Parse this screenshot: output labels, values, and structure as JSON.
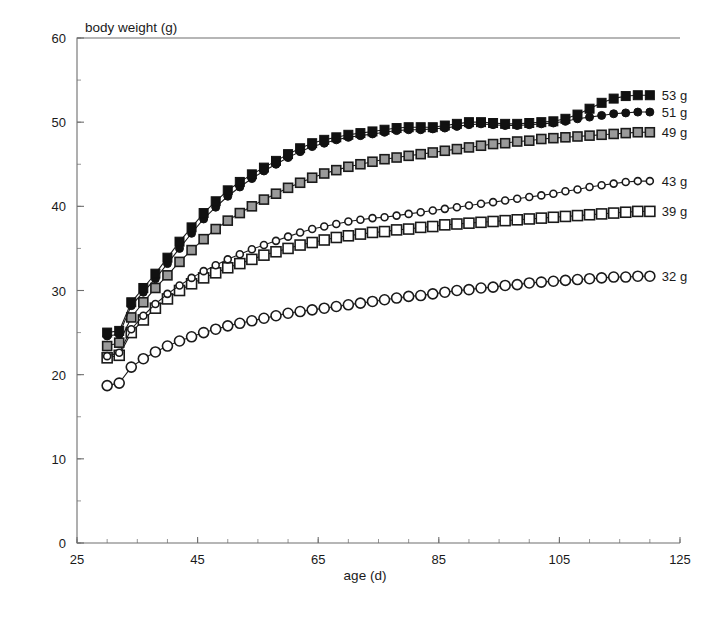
{
  "chart_data": {
    "type": "line",
    "title": "",
    "xlabel": "age (d)",
    "ylabel": "body weight (g)",
    "xlim": [
      25,
      125
    ],
    "ylim": [
      0,
      60
    ],
    "x_ticks": [
      25,
      45,
      65,
      85,
      105,
      125
    ],
    "y_ticks": [
      0,
      10,
      20,
      30,
      40,
      50,
      60
    ],
    "x_minor_step": 5,
    "y_minor_step": 5,
    "grid": false,
    "legend_position": "right-end-labels",
    "series": [
      {
        "name": "53 g",
        "label": "53 g",
        "marker": "filled-square",
        "marker_size": 9,
        "fill": "#111111",
        "stroke": "#111111",
        "x": [
          30,
          32,
          34,
          36,
          38,
          40,
          42,
          44,
          46,
          48,
          50,
          52,
          54,
          56,
          58,
          60,
          62,
          64,
          66,
          68,
          70,
          72,
          74,
          76,
          78,
          80,
          82,
          84,
          86,
          88,
          90,
          92,
          94,
          96,
          98,
          100,
          102,
          104,
          106,
          108,
          110,
          112,
          114,
          116,
          118,
          120
        ],
        "y": [
          25.0,
          25.2,
          28.6,
          30.3,
          32.0,
          33.9,
          35.8,
          37.5,
          39.2,
          40.6,
          41.9,
          42.9,
          43.8,
          44.6,
          45.4,
          46.2,
          46.9,
          47.5,
          47.9,
          48.2,
          48.5,
          48.7,
          48.9,
          49.1,
          49.3,
          49.4,
          49.4,
          49.4,
          49.6,
          49.8,
          50.0,
          50.0,
          49.9,
          49.8,
          49.8,
          49.9,
          50.0,
          50.1,
          50.4,
          50.9,
          51.6,
          52.3,
          52.8,
          53.1,
          53.2,
          53.2
        ]
      },
      {
        "name": "51 g",
        "label": "51 g",
        "marker": "filled-circle",
        "marker_size": 8,
        "fill": "#111111",
        "stroke": "#111111",
        "x": [
          30,
          32,
          34,
          36,
          38,
          40,
          42,
          44,
          46,
          48,
          50,
          52,
          54,
          56,
          58,
          60,
          62,
          64,
          66,
          68,
          70,
          72,
          74,
          76,
          78,
          80,
          82,
          84,
          86,
          88,
          90,
          92,
          94,
          96,
          98,
          100,
          102,
          104,
          106,
          108,
          110,
          112,
          114,
          116,
          118,
          120
        ],
        "y": [
          24.6,
          24.8,
          28.2,
          29.8,
          31.4,
          33.2,
          35.0,
          36.8,
          38.5,
          39.9,
          41.2,
          42.3,
          43.3,
          44.2,
          45.0,
          45.8,
          46.5,
          47.1,
          47.5,
          47.9,
          48.2,
          48.4,
          48.6,
          48.8,
          49.0,
          49.1,
          49.1,
          49.2,
          49.3,
          49.5,
          49.7,
          49.8,
          49.7,
          49.6,
          49.6,
          49.7,
          49.8,
          49.9,
          50.1,
          50.4,
          50.6,
          50.8,
          51.0,
          51.1,
          51.2,
          51.2
        ]
      },
      {
        "name": "49 g",
        "label": "49 g",
        "marker": "gray-square",
        "marker_size": 9,
        "fill": "#9a9a9a",
        "stroke": "#1a1a1a",
        "x": [
          30,
          32,
          34,
          36,
          38,
          40,
          42,
          44,
          46,
          48,
          50,
          52,
          54,
          56,
          58,
          60,
          62,
          64,
          66,
          68,
          70,
          72,
          74,
          76,
          78,
          80,
          82,
          84,
          86,
          88,
          90,
          92,
          94,
          96,
          98,
          100,
          102,
          104,
          106,
          108,
          110,
          112,
          114,
          116,
          118,
          120
        ],
        "y": [
          23.4,
          23.8,
          26.8,
          28.6,
          30.3,
          31.8,
          33.4,
          34.8,
          36.1,
          37.3,
          38.3,
          39.2,
          40.0,
          40.8,
          41.5,
          42.2,
          42.8,
          43.4,
          43.9,
          44.3,
          44.7,
          45.0,
          45.3,
          45.6,
          45.8,
          46.0,
          46.2,
          46.4,
          46.6,
          46.8,
          47.0,
          47.2,
          47.4,
          47.5,
          47.7,
          47.8,
          48.0,
          48.1,
          48.2,
          48.3,
          48.4,
          48.5,
          48.6,
          48.7,
          48.8,
          48.8
        ]
      },
      {
        "name": "43 g",
        "label": "43 g",
        "marker": "open-circle-small",
        "marker_size": 7,
        "fill": "#ffffff",
        "stroke": "#1a1a1a",
        "x": [
          30,
          32,
          34,
          36,
          38,
          40,
          42,
          44,
          46,
          48,
          50,
          52,
          54,
          56,
          58,
          60,
          62,
          64,
          66,
          68,
          70,
          72,
          74,
          76,
          78,
          80,
          82,
          84,
          86,
          88,
          90,
          92,
          94,
          96,
          98,
          100,
          102,
          104,
          106,
          108,
          110,
          112,
          114,
          116,
          118,
          120
        ],
        "y": [
          22.2,
          22.6,
          25.4,
          27.0,
          28.4,
          29.6,
          30.6,
          31.5,
          32.3,
          33.0,
          33.7,
          34.3,
          34.9,
          35.4,
          35.9,
          36.4,
          36.9,
          37.3,
          37.6,
          37.9,
          38.2,
          38.4,
          38.6,
          38.7,
          38.9,
          39.1,
          39.3,
          39.5,
          39.7,
          39.9,
          40.1,
          40.3,
          40.5,
          40.7,
          40.9,
          41.1,
          41.3,
          41.5,
          41.8,
          42.0,
          42.3,
          42.5,
          42.7,
          42.9,
          43.0,
          43.0
        ]
      },
      {
        "name": "39 g",
        "label": "39 g",
        "marker": "open-square",
        "marker_size": 10,
        "fill": "#ffffff",
        "stroke": "#1a1a1a",
        "x": [
          30,
          32,
          34,
          36,
          38,
          40,
          42,
          44,
          46,
          48,
          50,
          52,
          54,
          56,
          58,
          60,
          62,
          64,
          66,
          68,
          70,
          72,
          74,
          76,
          78,
          80,
          82,
          84,
          86,
          88,
          90,
          92,
          94,
          96,
          98,
          100,
          102,
          104,
          106,
          108,
          110,
          112,
          114,
          116,
          118,
          120
        ],
        "y": [
          22.0,
          22.3,
          25.0,
          26.5,
          27.9,
          29.0,
          30.0,
          30.8,
          31.5,
          32.1,
          32.7,
          33.2,
          33.7,
          34.2,
          34.6,
          35.0,
          35.4,
          35.7,
          36.0,
          36.3,
          36.5,
          36.7,
          36.9,
          37.0,
          37.2,
          37.3,
          37.5,
          37.6,
          37.8,
          37.9,
          38.0,
          38.1,
          38.2,
          38.3,
          38.4,
          38.5,
          38.6,
          38.7,
          38.8,
          38.9,
          39.0,
          39.1,
          39.2,
          39.3,
          39.4,
          39.4
        ]
      },
      {
        "name": "32 g",
        "label": "32 g",
        "marker": "open-circle-large",
        "marker_size": 10,
        "fill": "#ffffff",
        "stroke": "#1a1a1a",
        "x": [
          30,
          32,
          34,
          36,
          38,
          40,
          42,
          44,
          46,
          48,
          50,
          52,
          54,
          56,
          58,
          60,
          62,
          64,
          66,
          68,
          70,
          72,
          74,
          76,
          78,
          80,
          82,
          84,
          86,
          88,
          90,
          92,
          94,
          96,
          98,
          100,
          102,
          104,
          106,
          108,
          110,
          112,
          114,
          116,
          118,
          120
        ],
        "y": [
          18.7,
          19.0,
          20.9,
          21.9,
          22.7,
          23.4,
          24.0,
          24.5,
          25.0,
          25.4,
          25.8,
          26.1,
          26.4,
          26.7,
          27.0,
          27.3,
          27.5,
          27.7,
          27.9,
          28.1,
          28.3,
          28.5,
          28.7,
          28.9,
          29.1,
          29.3,
          29.4,
          29.6,
          29.8,
          30.0,
          30.1,
          30.3,
          30.4,
          30.6,
          30.7,
          30.9,
          31.0,
          31.1,
          31.2,
          31.3,
          31.4,
          31.5,
          31.6,
          31.6,
          31.7,
          31.7
        ]
      }
    ]
  }
}
